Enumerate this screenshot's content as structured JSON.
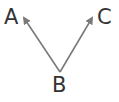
{
  "diagram": {
    "nodes": [
      {
        "id": "A",
        "label": "A"
      },
      {
        "id": "B",
        "label": "B"
      },
      {
        "id": "C",
        "label": "C"
      }
    ],
    "edges": [
      {
        "from": "B",
        "to": "A",
        "directed": true
      },
      {
        "from": "B",
        "to": "C",
        "directed": true
      }
    ],
    "colors": {
      "arrow": "#7a7a7a",
      "text": "#333333",
      "background": "#ffffff"
    }
  }
}
